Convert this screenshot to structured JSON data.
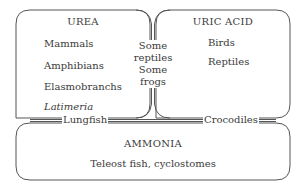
{
  "urea": {
    "title": "UREA",
    "items": [
      "Mammals",
      "Amphibians",
      "Elasmobranchs",
      "Latimeria"
    ]
  },
  "uric_acid": {
    "title": "URIC ACID",
    "items": [
      "Birds",
      "Reptiles"
    ]
  },
  "ammonia": {
    "title": "AMMONIA",
    "items": [
      "Teleost fish, cyclostomes"
    ]
  },
  "between_urea_uric": {
    "lines": [
      "Some",
      "reptiles",
      "Some",
      "frogs"
    ]
  },
  "between_urea_ammonia": {
    "label": "Lungfish"
  },
  "between_uric_ammonia": {
    "label": "Crocodiles"
  },
  "colors": {
    "line": "#555555",
    "text": "#3a3a3a",
    "background": "#ffffff"
  }
}
